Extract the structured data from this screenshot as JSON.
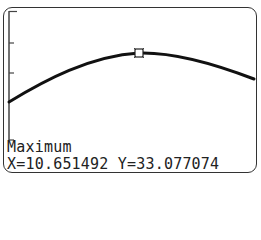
{
  "calculator": {
    "mode": "graph",
    "calc_label": "Maximum",
    "coordinates": "X=10.651492 Y=33.077074",
    "x_value": "10.651492",
    "y_value": "33.077074"
  },
  "graph": {
    "y_axis_ticks": 4,
    "curve_color": "#111111",
    "cursor_style": "square"
  }
}
